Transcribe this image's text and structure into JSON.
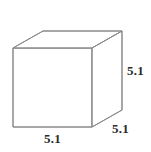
{
  "figure": {
    "type": "geometry-diagram",
    "shape": "cube",
    "background_color": "#ffffff",
    "stroke_color": "#8a8a8a",
    "label_color": "#2b2b2b",
    "labels": {
      "height": "5.1",
      "depth": "5.1",
      "width": "5.1"
    },
    "geometry": {
      "front_top_left": [
        13,
        48
      ],
      "front_top_right": [
        92,
        48
      ],
      "front_bottom_right": [
        92,
        127
      ],
      "front_bottom_left": [
        13,
        127
      ],
      "back_top_left": [
        43,
        31
      ],
      "back_top_right": [
        122,
        31
      ],
      "back_bottom_right": [
        122,
        110
      ]
    }
  }
}
